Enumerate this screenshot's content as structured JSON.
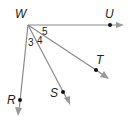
{
  "diagram": {
    "type": "geometry-rays",
    "vertex": {
      "label": "W",
      "x": 28,
      "y": 25
    },
    "rays": [
      {
        "name": "ray-WU",
        "point_label": "U",
        "point": [
          110,
          25
        ],
        "end": [
          123,
          25
        ]
      },
      {
        "name": "ray-WT",
        "point_label": "T",
        "point": [
          96,
          70
        ],
        "end": [
          108,
          78
        ]
      },
      {
        "name": "ray-WS",
        "point_label": "S",
        "point": [
          63,
          92
        ],
        "end": [
          70,
          104
        ]
      },
      {
        "name": "ray-WR",
        "point_label": "R",
        "point": [
          20,
          100
        ],
        "end": [
          18,
          115
        ]
      }
    ],
    "angles": [
      {
        "label": "3",
        "between": [
          "WR",
          "WS"
        ]
      },
      {
        "label": "4",
        "between": [
          "WS",
          "WT"
        ]
      },
      {
        "label": "5",
        "between": [
          "WT",
          "WU"
        ]
      }
    ],
    "colors": {
      "ray": "#8a8a8a",
      "point": "#111111",
      "text": "#222222"
    }
  }
}
